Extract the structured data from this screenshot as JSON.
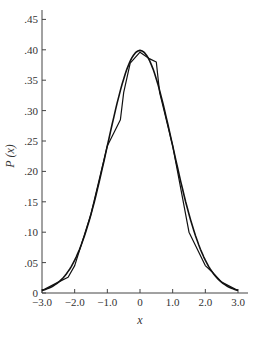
{
  "chart_data": {
    "type": "line",
    "title": "",
    "xlabel": "x",
    "ylabel": "P (x)",
    "xlim": [
      -3.0,
      3.0
    ],
    "ylim": [
      0,
      0.46
    ],
    "grid": false,
    "legend": "none",
    "x_ticks": [
      "-3.0",
      "-2.0",
      "-1.0",
      "0",
      "1.0",
      "2.0",
      "3.0"
    ],
    "y_ticks": [
      "0",
      ".05",
      ".10",
      ".15",
      ".20",
      ".25",
      ".30",
      ".35",
      ".40",
      ".45"
    ],
    "series": [
      {
        "name": "smooth normal curve",
        "x": [
          -3.0,
          -2.75,
          -2.5,
          -2.25,
          -2.0,
          -1.75,
          -1.5,
          -1.25,
          -1.0,
          -0.75,
          -0.5,
          -0.25,
          0.0,
          0.25,
          0.5,
          0.75,
          1.0,
          1.25,
          1.5,
          1.75,
          2.0,
          2.25,
          2.5,
          2.75,
          3.0
        ],
        "values": [
          0.004,
          0.009,
          0.018,
          0.032,
          0.054,
          0.086,
          0.13,
          0.183,
          0.242,
          0.301,
          0.352,
          0.387,
          0.399,
          0.387,
          0.352,
          0.301,
          0.242,
          0.183,
          0.13,
          0.086,
          0.054,
          0.032,
          0.018,
          0.009,
          0.004
        ]
      },
      {
        "name": "empirical polygon",
        "x": [
          -3.0,
          -2.5,
          -2.2,
          -2.0,
          -1.5,
          -1.0,
          -0.6,
          -0.5,
          -0.3,
          0.0,
          0.3,
          0.5,
          0.6,
          1.0,
          1.5,
          2.0,
          2.2,
          2.5,
          3.0
        ],
        "values": [
          0.004,
          0.018,
          0.026,
          0.045,
          0.13,
          0.242,
          0.285,
          0.33,
          0.378,
          0.396,
          0.385,
          0.38,
          0.33,
          0.242,
          0.1,
          0.045,
          0.035,
          0.018,
          0.004
        ]
      }
    ]
  }
}
